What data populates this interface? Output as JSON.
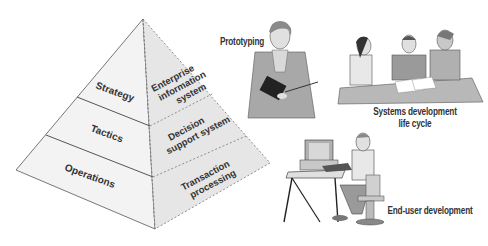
{
  "pyramid": {
    "left_face_levels": [
      "Strategy",
      "Tactics",
      "Operations"
    ],
    "right_face_systems": [
      [
        "Enterprise",
        "information",
        "system"
      ],
      [
        "Decision",
        "support system"
      ],
      [
        "Transaction",
        "processing"
      ]
    ]
  },
  "methods": {
    "prototyping": "Prototyping",
    "sdlc_line1": "Systems development",
    "sdlc_line2": "life cycle",
    "end_user": "End-user development"
  },
  "colors": {
    "left_face": "#f2f2f2",
    "right_face": "#e4e4e4",
    "outline": "#555555",
    "text": "#333333",
    "figure_gray": "#9a9a9a"
  }
}
